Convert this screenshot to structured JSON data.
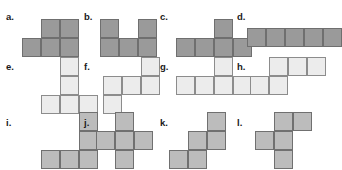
{
  "page": {
    "background_color": "#ffffff",
    "width": 322,
    "height": 170
  },
  "palette": {
    "row1_fill": "#9a9a9a",
    "row1_border": "#6f6f6f",
    "row2_fill": "#ececec",
    "row2_border": "#8c8c8c",
    "row3_fill": "#bcbcbc",
    "row3_border": "#707070",
    "label_color": "#1a1a1a"
  },
  "grid": {
    "cell_size": 19
  },
  "shapes": [
    {
      "id": "a",
      "label": "a.",
      "tone": "tone-dark",
      "label_x": 6,
      "label_y": 12,
      "grid_x": 22,
      "grid_y": 19,
      "cols": 3,
      "rows": 2,
      "cells": [
        0,
        1,
        1,
        1,
        1,
        1
      ]
    },
    {
      "id": "b",
      "label": "b.",
      "tone": "tone-dark",
      "label_x": 84,
      "label_y": 12,
      "grid_x": 100,
      "grid_y": 19,
      "cols": 3,
      "rows": 2,
      "cells": [
        1,
        0,
        1,
        1,
        1,
        1
      ]
    },
    {
      "id": "c",
      "label": "c.",
      "tone": "tone-dark",
      "label_x": 160,
      "label_y": 12,
      "grid_x": 176,
      "grid_y": 19,
      "cols": 4,
      "rows": 2,
      "cells": [
        0,
        0,
        1,
        0,
        1,
        1,
        1,
        1
      ]
    },
    {
      "id": "d",
      "label": "d.",
      "tone": "tone-dark",
      "label_x": 237,
      "label_y": 12,
      "grid_x": 247,
      "grid_y": 28,
      "cols": 5,
      "rows": 1,
      "cells": [
        1,
        1,
        1,
        1,
        1
      ]
    },
    {
      "id": "e",
      "label": "e.",
      "tone": "tone-light",
      "label_x": 6,
      "label_y": 62,
      "grid_x": 41,
      "grid_y": 57,
      "cols": 3,
      "rows": 3,
      "cells": [
        0,
        1,
        0,
        0,
        1,
        0,
        1,
        1,
        1
      ]
    },
    {
      "id": "f",
      "label": "f.",
      "tone": "tone-light",
      "label_x": 84,
      "label_y": 62,
      "grid_x": 103,
      "grid_y": 57,
      "cols": 3,
      "rows": 3,
      "cells": [
        0,
        0,
        1,
        1,
        1,
        1,
        1,
        0,
        0
      ]
    },
    {
      "id": "g",
      "label": "g.",
      "tone": "tone-light",
      "label_x": 160,
      "label_y": 62,
      "grid_x": 176,
      "grid_y": 57,
      "cols": 4,
      "rows": 2,
      "cells": [
        0,
        0,
        1,
        0,
        1,
        1,
        1,
        1
      ]
    },
    {
      "id": "h",
      "label": "h.",
      "tone": "tone-light",
      "label_x": 237,
      "label_y": 62,
      "grid_x": 250,
      "grid_y": 57,
      "cols": 4,
      "rows": 2,
      "cells": [
        0,
        1,
        1,
        1,
        1,
        1,
        0,
        0
      ]
    },
    {
      "id": "i",
      "label": "i.",
      "tone": "tone-mid",
      "label_x": 6,
      "label_y": 118,
      "grid_x": 41,
      "grid_y": 112,
      "cols": 3,
      "rows": 3,
      "cells": [
        0,
        0,
        1,
        0,
        0,
        1,
        1,
        1,
        1
      ]
    },
    {
      "id": "j",
      "label": "j.",
      "tone": "tone-mid",
      "label_x": 84,
      "label_y": 118,
      "grid_x": 96,
      "grid_y": 112,
      "cols": 3,
      "rows": 3,
      "cells": [
        0,
        1,
        0,
        1,
        1,
        1,
        0,
        1,
        0
      ]
    },
    {
      "id": "k",
      "label": "k.",
      "tone": "tone-mid",
      "label_x": 160,
      "label_y": 118,
      "grid_x": 169,
      "grid_y": 112,
      "cols": 3,
      "rows": 3,
      "cells": [
        0,
        0,
        1,
        0,
        1,
        1,
        1,
        1,
        0
      ]
    },
    {
      "id": "l",
      "label": "l.",
      "tone": "tone-mid",
      "label_x": 237,
      "label_y": 118,
      "grid_x": 255,
      "grid_y": 112,
      "cols": 3,
      "rows": 3,
      "cells": [
        0,
        1,
        1,
        1,
        1,
        0,
        0,
        1,
        0
      ]
    }
  ]
}
